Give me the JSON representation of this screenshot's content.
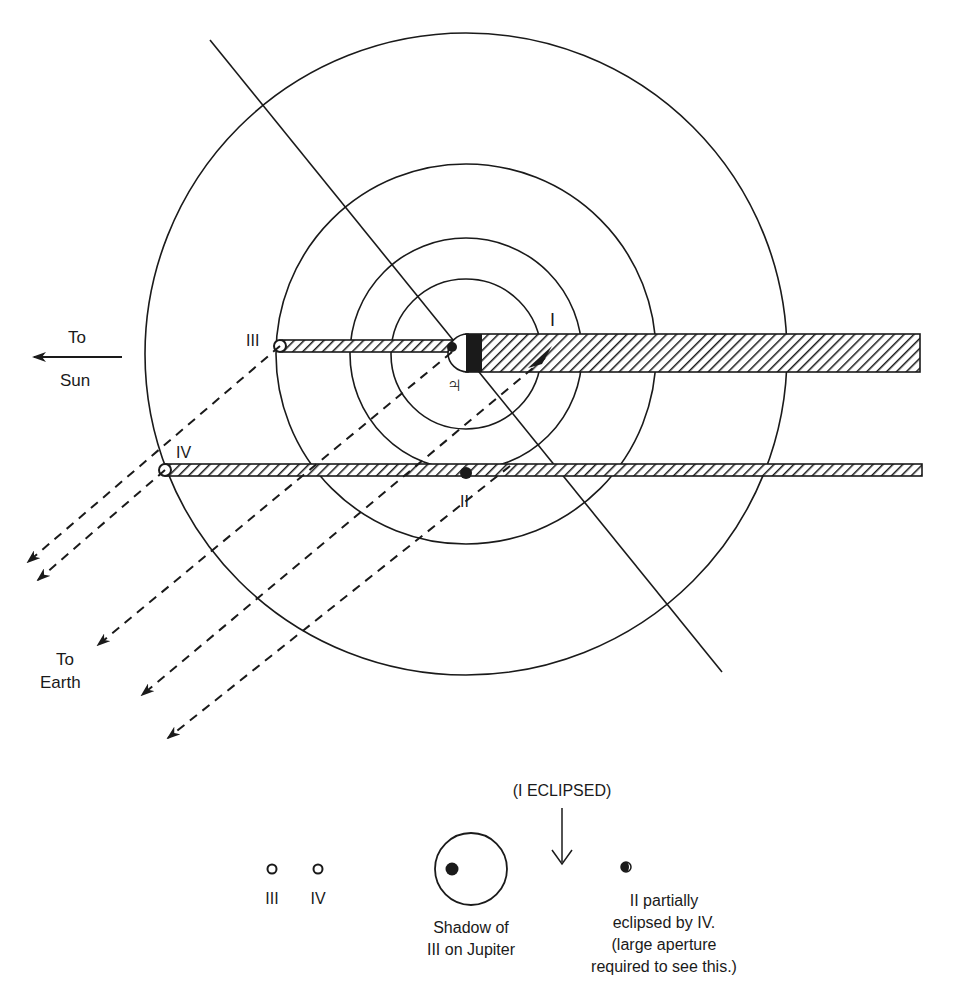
{
  "diagram": {
    "jupiter_symbol": "♃",
    "satellites": {
      "I": "I",
      "II": "II",
      "III": "III",
      "IV": "IV"
    },
    "labels": {
      "to_sun_top": "To",
      "to_sun_bottom": "Sun",
      "to_earth_top": "To",
      "to_earth_bottom": "Earth"
    },
    "legend": {
      "i_eclipsed": "(I ECLIPSED)",
      "sat_iii": "III",
      "sat_iv": "IV",
      "shadow_line1": "Shadow of",
      "shadow_line2": "III on Jupiter",
      "ii_line1": "II partially",
      "ii_line2": "eclipsed by IV.",
      "ii_line3": "(large aperture",
      "ii_line4": "required to see this.)"
    },
    "colors": {
      "ink": "#1a1a1a",
      "background": "#ffffff"
    }
  }
}
